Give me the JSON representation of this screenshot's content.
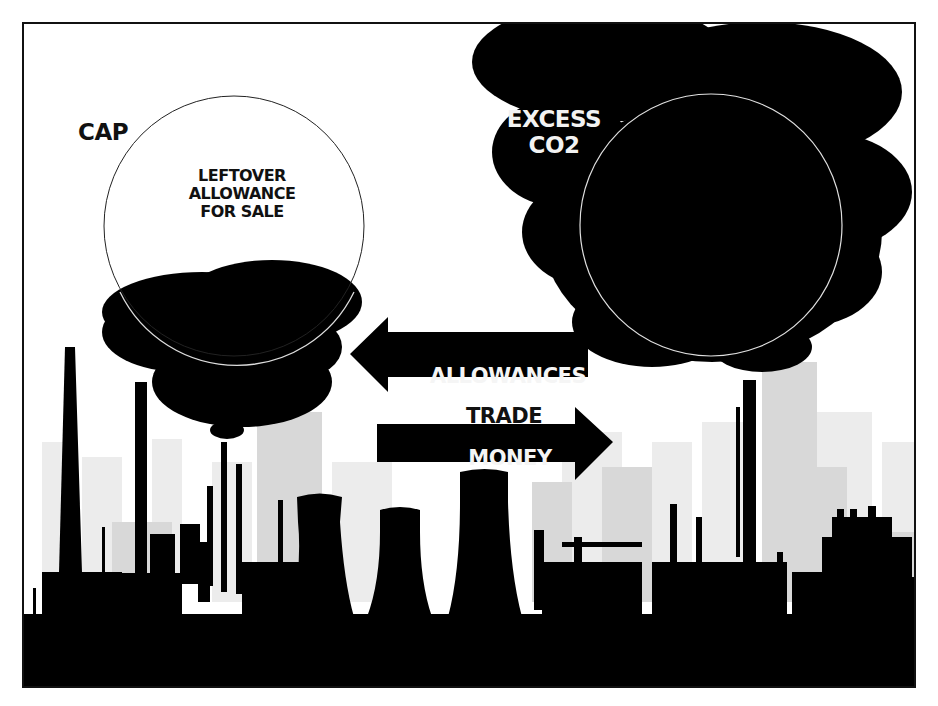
{
  "diagram": {
    "left_factory": {
      "cap_label": "CAP",
      "circle_label_lines": [
        "LEFTOVER",
        "ALLOWANCE",
        "FOR SALE"
      ],
      "circle_label": "LEFTOVER\nALLOWANCE\nFOR SALE"
    },
    "right_factory": {
      "cloud_label_lines": [
        "EXCESS",
        "CO2"
      ],
      "cloud_label": "EXCESS\nCO2"
    },
    "trade": {
      "allowances_arrow": {
        "label": "ALLOWANCES",
        "direction": "left"
      },
      "center_label": "TRADE",
      "money_arrow": {
        "label": "MONEY",
        "direction": "right"
      }
    },
    "colors": {
      "silhouette": "#000000",
      "background": "#ffffff",
      "skyline_far": "#e6e6e6",
      "skyline_mid": "#d4d4d4",
      "circle_outline_left": "#222222",
      "circle_outline_right": "#dddddd"
    }
  }
}
